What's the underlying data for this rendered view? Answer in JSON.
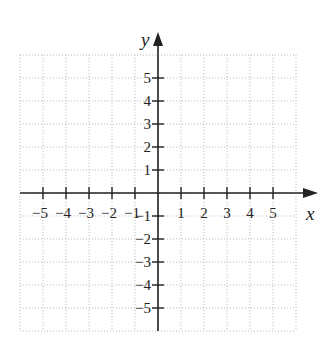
{
  "diagram": {
    "type": "coordinate-plane",
    "x_axis": {
      "label": "x",
      "min": -6,
      "max": 6,
      "tick_labels": [
        "−5",
        "−4",
        "−3",
        "−2",
        "−1",
        "1",
        "2",
        "3",
        "4",
        "5"
      ],
      "tick_values": [
        -5,
        -4,
        -3,
        -2,
        -1,
        1,
        2,
        3,
        4,
        5
      ]
    },
    "y_axis": {
      "label": "y",
      "min": -6,
      "max": 6,
      "tick_labels": [
        "5",
        "4",
        "3",
        "2",
        "1",
        "−1",
        "−2",
        "−3",
        "−4",
        "−5"
      ],
      "tick_values": [
        5,
        4,
        3,
        2,
        1,
        -1,
        -2,
        -3,
        -4,
        -5
      ]
    },
    "grid": {
      "style": "dotted",
      "color": "#bbbbbb",
      "step": 1
    },
    "axis_color": "#222222"
  }
}
